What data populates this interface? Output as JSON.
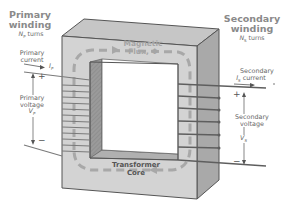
{
  "diagram": {
    "type": "transformer-schematic",
    "primary": {
      "title_line1": "Primary",
      "title_line2": "winding",
      "turns_symbol": "N",
      "turns_subscript": "P",
      "turns_label": "turns",
      "current_line1": "Primary",
      "current_line2": "current",
      "current_symbol": "I",
      "current_subscript": "P",
      "voltage_line1": "Primary",
      "voltage_line2": "voltage",
      "voltage_symbol": "V",
      "voltage_subscript": "P",
      "plus": "+",
      "minus": "−"
    },
    "secondary": {
      "title_line1": "Secondary",
      "title_line2": "winding",
      "turns_symbol": "N",
      "turns_subscript": "S",
      "turns_label": "turns",
      "current_line1": "Secondary",
      "current_line2": "current",
      "current_symbol": "I",
      "current_subscript": "S",
      "voltage_line1": "Secondary",
      "voltage_line2": "voltage",
      "voltage_symbol": "V",
      "voltage_subscript": "S",
      "plus": "+",
      "minus": "−"
    },
    "flux": {
      "line1": "Magnetic",
      "line2": "Flux, Φ"
    },
    "core": {
      "line1": "Transformer",
      "line2": "Core"
    },
    "colors": {
      "core_front": "#d2d2d2",
      "core_top": "#c4c4c4",
      "core_side": "#a9a9a9",
      "inner_wall": "#8e8e8e",
      "flux_dash": "#a8a8a8",
      "winding_wire": "#6a6a6a",
      "label_text": "#6b6b6b"
    }
  }
}
